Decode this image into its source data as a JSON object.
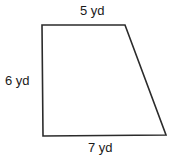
{
  "diagram": {
    "type": "right-trapezoid",
    "stroke_color": "#2b2b2b",
    "fill_color": "#ffffff",
    "vertices": {
      "top_left": [
        42,
        25
      ],
      "top_right": [
        125,
        25
      ],
      "bottom_right": [
        166,
        135
      ],
      "bottom_left": [
        43,
        136
      ]
    },
    "labels": {
      "top": "5 yd",
      "left": "6 yd",
      "bottom": "7 yd"
    }
  }
}
